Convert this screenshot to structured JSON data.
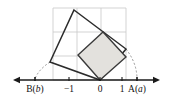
{
  "figure": {
    "background_color": "#ffffff",
    "width": 170,
    "height": 105
  },
  "axis": {
    "name": "number-line",
    "y": 80,
    "x_start": 13,
    "x_end": 160,
    "color": "#1a1a1a",
    "stroke_width": 1.6,
    "arrowheads": [
      "left",
      "right"
    ],
    "ticks": [
      {
        "id": "tick-b",
        "label": "B(b)",
        "label_plain": "B(",
        "label_italic": "b",
        "label_close": ")",
        "x": 35,
        "has_tick_mark": true,
        "dashed": true
      },
      {
        "id": "tick-neg1",
        "label": "−1",
        "x": 69,
        "has_tick_mark": true,
        "dashed": false
      },
      {
        "id": "tick-zero",
        "label": "0",
        "x": 100,
        "has_tick_mark": true,
        "dashed": false
      },
      {
        "id": "tick-one",
        "label": "1",
        "x": 122,
        "has_tick_mark": true,
        "dashed": false
      },
      {
        "id": "tick-a",
        "label": "A(a)",
        "label_plain": "A(",
        "label_italic": "a",
        "label_close": ")",
        "x": 137,
        "has_tick_mark": true,
        "dashed": true
      }
    ],
    "label_y": 92,
    "label_font_size": 9.5
  },
  "grid": {
    "color": "#c8c8c8",
    "stroke_width": 0.8,
    "x_min": 53,
    "x_max": 126,
    "y_min": 8,
    "y_max": 80,
    "vertical_lines_x": [
      53,
      77,
      101,
      126
    ],
    "horizontal_lines_y": [
      8,
      32,
      56,
      80
    ]
  },
  "shapes": {
    "large_square": {
      "name": "large-tilted-square",
      "fill": "none",
      "stroke": "#2b2b2b",
      "stroke_width": 1.5,
      "points": "74,10 126,49 100,80 50,62",
      "vertices": [
        {
          "x": 74,
          "y": 10
        },
        {
          "x": 126,
          "y": 49
        },
        {
          "x": 100,
          "y": 80
        },
        {
          "x": 50,
          "y": 62
        }
      ]
    },
    "small_square": {
      "name": "small-shaded-square",
      "fill": "#e3e1dd",
      "stroke": "#3a3a3a",
      "stroke_width": 1.4,
      "points": "103,32 126,57 100,80 78,55",
      "vertices": [
        {
          "x": 103,
          "y": 32
        },
        {
          "x": 126,
          "y": 57
        },
        {
          "x": 100,
          "y": 80
        },
        {
          "x": 78,
          "y": 55
        }
      ]
    }
  },
  "arcs": [
    {
      "name": "arc-left-to-b",
      "path": "M 50 62 Q 38 70 35 79",
      "stroke": "#8a8a8a",
      "stroke_width": 0.9,
      "dash": "2,2"
    },
    {
      "name": "arc-right-to-a",
      "path": "M 126 49 Q 137 63 137 79",
      "stroke": "#8a8a8a",
      "stroke_width": 0.9,
      "dash": "2,2"
    }
  ],
  "chart_data": {
    "type": "scatter",
    "xlabel": "",
    "ylabel": "",
    "xlim": [
      13,
      160
    ],
    "grid": true,
    "legend": null,
    "tick_labels": [
      "B(b)",
      "−1",
      "0",
      "1",
      "A(a)"
    ],
    "tick_positions_px": [
      35,
      69,
      100,
      122,
      137
    ],
    "annotations": [
      "Large tilted square with vertices at (74,10), (126,49), (100,80), (50,62)",
      "Small shaded tilted square with vertices at (103,32), (126,57), (100,80), (78,55)",
      "Dashed arc from large square left vertex down to point B(b)",
      "Dashed arc from large square right vertex down to point A(a)"
    ]
  }
}
